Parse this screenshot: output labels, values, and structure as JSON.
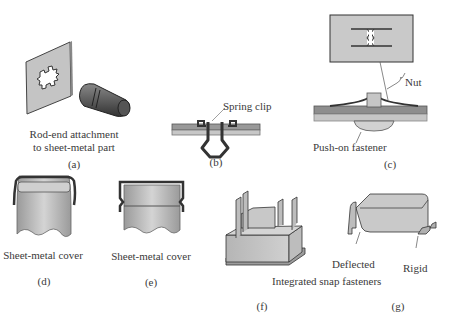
{
  "figure": {
    "panels": [
      {
        "id": "a",
        "caption_line1": "Rod-end attachment",
        "caption_line2": "to sheet-metal part",
        "tag": "(a)",
        "part": "star-hole plate and rod"
      },
      {
        "id": "b",
        "callout": "Spring clip",
        "tag": "(b)",
        "part": "spring clip through sheet"
      },
      {
        "id": "c",
        "callout": "Nut",
        "caption": "Push-on fastener",
        "tag": "(c)",
        "part": "push-on nut top view and section"
      },
      {
        "id": "d",
        "caption": "Sheet-metal cover",
        "tag": "(d)"
      },
      {
        "id": "e",
        "caption": "Sheet-metal cover",
        "tag": "(e)"
      },
      {
        "id": "f",
        "tag": "(f)",
        "part": "box with snap legs"
      },
      {
        "id": "g",
        "callout_left": "Deflected",
        "callout_right": "Rigid",
        "tag": "(g)",
        "part": "cover with snap hooks"
      }
    ],
    "shared_caption_fg": "Integrated snap fasteners"
  },
  "colors": {
    "metal_light": "#c8c8c8",
    "metal_mid": "#a9a9a9",
    "metal_dark": "#555555",
    "outline": "#333333",
    "text": "#3a3a3a"
  }
}
